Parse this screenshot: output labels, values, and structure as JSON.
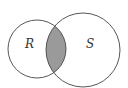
{
  "diagram": {
    "type": "venn",
    "sets": [
      {
        "label": "R",
        "cx": 37,
        "cy": 49,
        "r": 29
      },
      {
        "label": "S",
        "cx": 83,
        "cy": 50,
        "r": 37
      }
    ],
    "shaded_region": "R ∩ S",
    "colors": {
      "background": "#ffffff",
      "stroke": "#444444",
      "shade": "#9a9a9a"
    }
  }
}
